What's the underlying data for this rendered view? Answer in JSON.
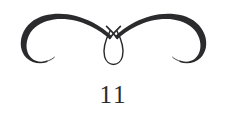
{
  "document": {
    "kind": "book-page-footer",
    "background_color": "#ffffff",
    "ink_color": "#2b2b2e"
  },
  "ornament": {
    "name": "calligraphic-flourish-divider",
    "description": "Symmetric double-swash ornament: two mirrored tapering hooks sweeping outward and down, crossing at center into a vertical teardrop loop",
    "stroke_color": "#2b2b2e",
    "symmetry": "horizontal-mirror",
    "elements": [
      "left-swash-hook",
      "right-swash-hook",
      "center-teardrop-loop"
    ]
  },
  "footer": {
    "page_number": "11"
  }
}
